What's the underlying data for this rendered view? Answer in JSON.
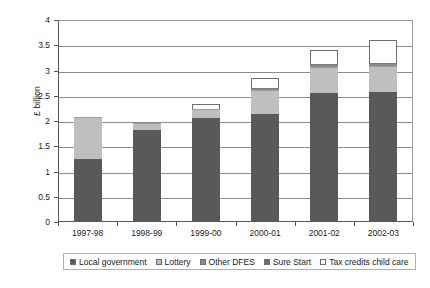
{
  "chart_data": {
    "type": "bar",
    "subtype": "stacked-bar",
    "title": "",
    "xlabel": "",
    "ylabel": "£ billion",
    "categories": [
      "1997-98",
      "1998-99",
      "1999-00",
      "2000-01",
      "2001-02",
      "2002-03"
    ],
    "ylim": [
      0,
      4
    ],
    "ytick_labels": [
      "0",
      "0.5",
      "1",
      "1.5",
      "2",
      "2.5",
      "3",
      "3.5",
      "4"
    ],
    "ytick_values": [
      0,
      0.5,
      1,
      1.5,
      2,
      2.5,
      3,
      3.5,
      4
    ],
    "grid": true,
    "grid_axis": "y",
    "legend_position": "bottom",
    "series": [
      {
        "name": "Local government",
        "color": "#595959",
        "values": [
          1.25,
          1.82,
          2.05,
          2.13,
          2.55,
          2.57
        ]
      },
      {
        "name": "Lottery",
        "color": "#bfbfbf",
        "values": [
          0.82,
          0.14,
          0.18,
          0.48,
          0.52,
          0.52
        ]
      },
      {
        "name": "Other DFES",
        "color": "#8c8c8c",
        "values": [
          0.0,
          0.0,
          0.0,
          0.05,
          0.05,
          0.06
        ]
      },
      {
        "name": "Sure Start",
        "color": "#6e6e6e",
        "values": [
          0.0,
          0.0,
          0.0,
          0.0,
          0.0,
          0.0
        ]
      },
      {
        "name": "Tax credits child care",
        "color": "#ffffff",
        "values": [
          0.0,
          0.0,
          0.11,
          0.2,
          0.28,
          0.45
        ]
      }
    ],
    "totals": [
      2.07,
      1.96,
      2.34,
      2.86,
      3.4,
      3.6
    ]
  },
  "axes": {
    "y_title": "£ billion"
  },
  "legend": {
    "items": [
      {
        "label": "Local government",
        "color": "#595959"
      },
      {
        "label": "Lottery",
        "color": "#bfbfbf"
      },
      {
        "label": "Other DFES",
        "color": "#8c8c8c"
      },
      {
        "label": "Sure Start",
        "color": "#6e6e6e"
      },
      {
        "label": "Tax credits child care",
        "color": "#ffffff"
      }
    ]
  },
  "colors": {
    "axis": "#555555",
    "grid": "#8c8c8c",
    "plot_background": "#ffffff",
    "page_background": "#ffffff"
  }
}
